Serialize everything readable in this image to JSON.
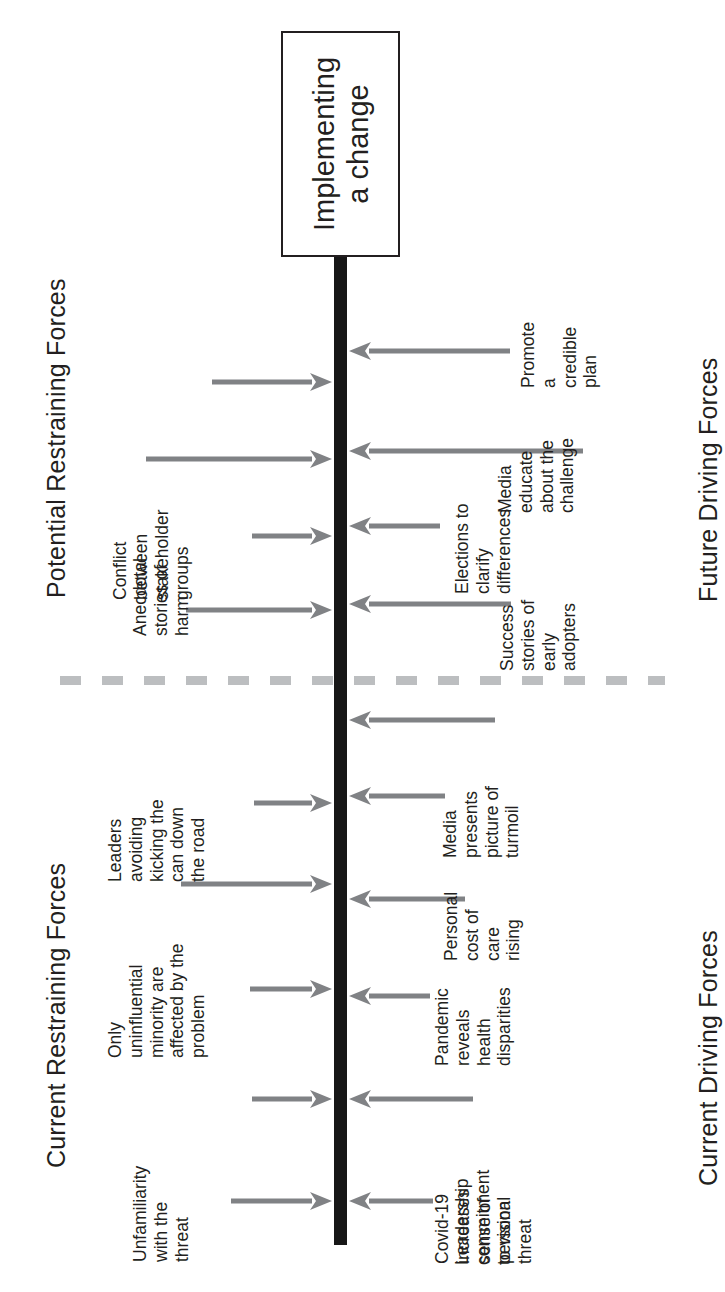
{
  "diagram": {
    "title_box": {
      "line1": "Implementing",
      "line2": "a change"
    },
    "headings": {
      "potential_restraining": "Potential Restraining Forces",
      "current_restraining": "Current Restraining Forces",
      "future_driving": "Future Driving Forces",
      "current_driving": "Current Driving Forces"
    },
    "colors": {
      "spine": "#171717",
      "arrow": "#808285",
      "text": "#231f20",
      "divider": "#bcbec0",
      "background": "#ffffff"
    },
    "restraining_forces": [
      {
        "label": "Conflict\nbetween\nstakeholder\ngroups",
        "group": "potential"
      },
      {
        "label": "Anecdotal\nstories of\nharm",
        "group": "potential"
      },
      {
        "label": "Leaders\navoiding\nkicking the\ncan down\nthe road",
        "group": "current"
      },
      {
        "label": "Only\nuninfluential\nminority are\naffected by the\nproblem",
        "group": "current"
      },
      {
        "label": "Unfamiliarity\nwith the\nthreat",
        "group": "current"
      }
    ],
    "driving_forces": [
      {
        "label": "Promote\na\ncredible\nplan",
        "group": "future"
      },
      {
        "label": "Media\neducate\nabout the\nchallenge",
        "group": "future"
      },
      {
        "label": "Elections to\nclarify\ndifferences",
        "group": "future"
      },
      {
        "label": "Success\nstories of\nearly\nadopters",
        "group": "future"
      },
      {
        "label": "Media\npresents\npicture of\nturmoil",
        "group": "current"
      },
      {
        "label": "Personal\ncost of\ncare\nrising",
        "group": "current"
      },
      {
        "label": "Pandemic\nreveals\nhealth\ndisparities",
        "group": "current"
      },
      {
        "label": "Covid-19\nincreases\nsense of\npersonal\nthreat",
        "group": "current"
      },
      {
        "label": "Leadership\ncommitment\nto vision",
        "group": "current"
      }
    ]
  }
}
